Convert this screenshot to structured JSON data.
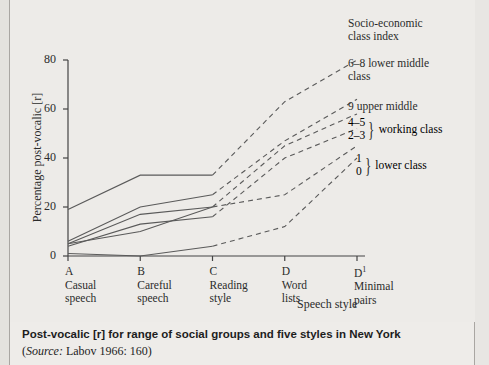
{
  "figure": {
    "caption_main_bold": "Post-vocalic",
    "caption_main_rest": " [r] for range of social groups and five styles in New York",
    "caption_source_label": "Source:",
    "caption_source_rest": " Labov 1966: 160)"
  },
  "legend": {
    "title_line1": "Socio-economic",
    "title_line2": "class index",
    "lower_middle_line1": "6–8 lower middle",
    "lower_middle_line2": "class",
    "upper_middle": "9 upper middle",
    "working_num1": "4–5",
    "working_num2": "2–3",
    "working_label": "working class",
    "lower_num1": "1",
    "lower_num2": "0",
    "lower_label": "lower class"
  },
  "chart_data": {
    "type": "line",
    "title": "Post-vocalic [r] for range of social groups and five styles in New York",
    "xlabel": "Speech style",
    "ylabel": "Percentage post-vocalic [r]",
    "ylim": [
      0,
      80
    ],
    "yticks": [
      0,
      20,
      40,
      60,
      80
    ],
    "ytick_labels": [
      "0",
      "20",
      "40",
      "60",
      "80"
    ],
    "grid": false,
    "legend_position": "right",
    "x": [
      "A",
      "B",
      "C",
      "D",
      "D¹"
    ],
    "x_codes": [
      "A",
      "B",
      "C",
      "D",
      "D¹"
    ],
    "x_tick_labels": [
      {
        "code": "A",
        "line1": "Casual",
        "line2": "speech"
      },
      {
        "code": "B",
        "line1": "Careful",
        "line2": "speech"
      },
      {
        "code": "C",
        "line1": "Reading",
        "line2": "style"
      },
      {
        "code": "D",
        "line1": "Word",
        "line2": "lists"
      },
      {
        "code": "D¹",
        "line1": "Minimal",
        "line2": "pairs"
      }
    ],
    "solid_segment": "A–C",
    "dashed_segment": "C–D¹",
    "series": [
      {
        "name": "9 upper middle",
        "group": "upper middle class",
        "values": [
          19,
          33,
          33,
          63,
          80
        ]
      },
      {
        "name": "6–8 lower middle class",
        "group": "lower middle class",
        "values": [
          6,
          20,
          25,
          47,
          64
        ]
      },
      {
        "name": "4–5 working class",
        "group": "working class",
        "values": [
          5,
          17,
          20,
          45,
          58
        ]
      },
      {
        "name": "2–3 working class",
        "group": "working class",
        "values": [
          4,
          13,
          16,
          40,
          52
        ]
      },
      {
        "name": "1 lower class",
        "group": "lower class",
        "values": [
          5,
          10,
          20,
          25,
          45
        ]
      },
      {
        "name": "0 lower class",
        "group": "lower class",
        "values": [
          1,
          0,
          4,
          12,
          40
        ]
      }
    ],
    "colors": {
      "line": "#5a5a5a",
      "axis": "#444444",
      "background": "#edebe8"
    }
  }
}
